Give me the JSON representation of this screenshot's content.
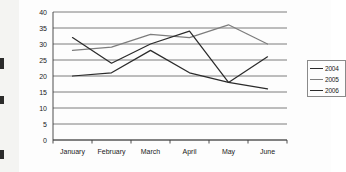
{
  "chart_data": {
    "type": "line",
    "title": "",
    "xlabel": "",
    "ylabel": "",
    "categories": [
      "January",
      "February",
      "March",
      "April",
      "May",
      "June"
    ],
    "yticks": [
      0,
      5,
      10,
      15,
      20,
      25,
      30,
      35,
      40
    ],
    "ylim": [
      0,
      40
    ],
    "grid": true,
    "legend_position": "right",
    "series": [
      {
        "name": "2004",
        "color": "#2b2b2b",
        "values": [
          20,
          21,
          28,
          21,
          18,
          16
        ]
      },
      {
        "name": "2005",
        "color": "#7d7d7d",
        "values": [
          28,
          29,
          33,
          32,
          36,
          30
        ]
      },
      {
        "name": "2006",
        "color": "#2b2b2b",
        "values": [
          32,
          24,
          30,
          34,
          18,
          26
        ]
      }
    ]
  },
  "legend": {
    "items": [
      {
        "label": "2004"
      },
      {
        "label": "2005"
      },
      {
        "label": "2006"
      }
    ]
  },
  "axis": {
    "y_labels": [
      "40",
      "35",
      "30",
      "25",
      "20",
      "15",
      "10",
      "5",
      "0"
    ],
    "x_labels": [
      "January",
      "February",
      "March",
      "April",
      "May",
      "June"
    ]
  },
  "colors": {
    "series_dark": "#2b2b2b",
    "series_gray": "#7d7d7d",
    "gridline": "#5a5a5a",
    "background": "#fdfdfd"
  }
}
